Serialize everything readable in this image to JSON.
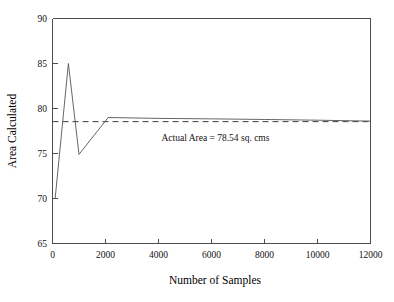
{
  "chart_data": {
    "type": "line",
    "title": "",
    "xlabel": "Number of Samples",
    "ylabel": "Area Calculated",
    "xlim": [
      0,
      12000
    ],
    "ylim": [
      65,
      90
    ],
    "xticks": [
      0,
      2000,
      4000,
      6000,
      8000,
      10000,
      12000
    ],
    "xtick_labels": [
      "0",
      "2000",
      "4000",
      "6000",
      "8000",
      "10000",
      "12000"
    ],
    "yticks": [
      65,
      70,
      75,
      80,
      85,
      90
    ],
    "ytick_labels": [
      "65",
      "70",
      "75",
      "80",
      "85",
      "90"
    ],
    "grid": false,
    "legend": false,
    "series": [
      {
        "name": "Calculated Area",
        "style": "solid",
        "color": "#555555",
        "x": [
          100,
          600,
          1000,
          2100,
          4000,
          6000,
          8000,
          10000,
          12000
        ],
        "values": [
          70.0,
          85.0,
          74.9,
          79.0,
          78.9,
          78.85,
          78.78,
          78.7,
          78.6
        ]
      },
      {
        "name": "Actual Area",
        "style": "dashed",
        "color": "#3d3d3d",
        "x": [
          0,
          12000
        ],
        "values": [
          78.54,
          78.54
        ]
      }
    ],
    "annotations": [
      {
        "text": "Actual Area = 78.54 sq. cms",
        "x": 6150,
        "y": 76.35
      }
    ],
    "reference_value": 78.54,
    "reference_units": "sq. cms"
  },
  "axes": {
    "y_title": "Area Calculated",
    "x_title": "Number of Samples"
  }
}
